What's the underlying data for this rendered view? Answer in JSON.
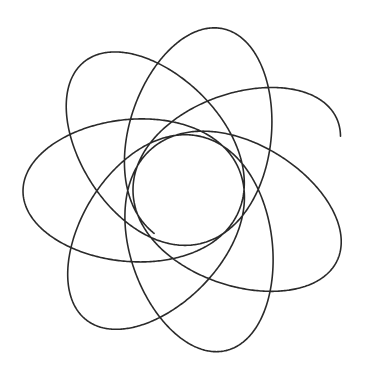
{
  "figure": {
    "type": "precessing-ellipse-rosette",
    "background": "#ffffff",
    "stroke_color": "#2a2a2a",
    "stroke_width": 1.6,
    "center": [
      188,
      190
    ],
    "ellipse_center_offset": 55,
    "semi_major": 110,
    "semi_minor": 84,
    "loops": 6.55,
    "precession_per_loop_deg": -51.4,
    "start_angle_deg": -52,
    "start_point": [
      258,
      71
    ],
    "end_point": [
      348,
      186
    ]
  }
}
